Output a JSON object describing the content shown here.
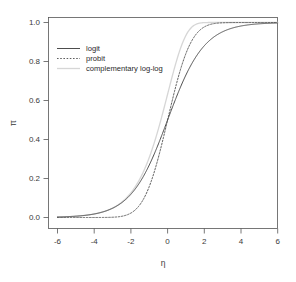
{
  "chart_data": {
    "type": "line",
    "title": "",
    "xlabel": "η",
    "ylabel": "π",
    "xlim": [
      -6,
      6
    ],
    "ylim": [
      0,
      1
    ],
    "xticks": [
      -6,
      -4,
      -2,
      0,
      2,
      4,
      6
    ],
    "xticklabels": [
      "-6",
      "-4",
      "-2",
      "0",
      "2",
      "4",
      "6"
    ],
    "yticks": [
      0.0,
      0.2,
      0.4,
      0.6,
      0.8,
      1.0
    ],
    "yticklabels": [
      "0.0",
      "0.2",
      "0.4",
      "0.6",
      "0.8",
      "1.0"
    ],
    "grid": false,
    "legend_position": "upper left",
    "series": [
      {
        "name": "logit",
        "linestyle": "solid",
        "color": "#4d4d4d",
        "formula": "1/(1+exp(-eta))",
        "x": [
          -6,
          -5.5,
          -5,
          -4.5,
          -4,
          -3.5,
          -3,
          -2.5,
          -2,
          -1.5,
          -1,
          -0.5,
          0,
          0.5,
          1,
          1.5,
          2,
          2.5,
          3,
          3.5,
          4,
          4.5,
          5,
          5.5,
          6
        ],
        "values": [
          0.002,
          0.004,
          0.007,
          0.011,
          0.018,
          0.029,
          0.047,
          0.076,
          0.119,
          0.182,
          0.269,
          0.378,
          0.5,
          0.622,
          0.731,
          0.818,
          0.881,
          0.924,
          0.953,
          0.971,
          0.982,
          0.989,
          0.993,
          0.996,
          0.998
        ]
      },
      {
        "name": "probit",
        "linestyle": "dotted",
        "color": "#4d4d4d",
        "formula": "pnorm(eta)",
        "x": [
          -6,
          -5.5,
          -5,
          -4.5,
          -4,
          -3.5,
          -3,
          -2.5,
          -2,
          -1.5,
          -1,
          -0.5,
          0,
          0.5,
          1,
          1.5,
          2,
          2.5,
          3,
          3.5,
          4,
          4.5,
          5,
          5.5,
          6
        ],
        "values": [
          0.0,
          0.0,
          0.0,
          0.0,
          0.0,
          0.0002,
          0.0013,
          0.0062,
          0.0228,
          0.0668,
          0.1587,
          0.3085,
          0.5,
          0.6915,
          0.8413,
          0.9332,
          0.9772,
          0.9938,
          0.9987,
          0.9998,
          1.0,
          1.0,
          1.0,
          1.0,
          1.0
        ]
      },
      {
        "name": "complementary log-log",
        "linestyle": "solid",
        "color": "#d6d6d6",
        "formula": "1-exp(-exp(eta))",
        "x": [
          -6,
          -5.5,
          -5,
          -4.5,
          -4,
          -3.5,
          -3,
          -2.5,
          -2,
          -1.5,
          -1,
          -0.5,
          0,
          0.5,
          1,
          1.5,
          2,
          2.5,
          3,
          3.5,
          4,
          4.5,
          5,
          5.5,
          6
        ],
        "values": [
          0.0025,
          0.0041,
          0.0067,
          0.011,
          0.0181,
          0.0296,
          0.0483,
          0.0781,
          0.1248,
          0.1959,
          0.3078,
          0.4559,
          0.6321,
          0.8076,
          0.934,
          0.9888,
          0.9994,
          1.0,
          1.0,
          1.0,
          1.0,
          1.0,
          1.0,
          1.0,
          1.0
        ]
      }
    ]
  },
  "legend": {
    "entries": [
      {
        "label": "logit"
      },
      {
        "label": "probit"
      },
      {
        "label": "complementary log-log"
      }
    ]
  },
  "axes": {
    "x_title": "η",
    "y_title": "π"
  },
  "colors": {
    "axis": "#555555",
    "logit": "#4d4d4d",
    "probit": "#4d4d4d",
    "cloglog": "#d6d6d6",
    "background": "#ffffff"
  }
}
